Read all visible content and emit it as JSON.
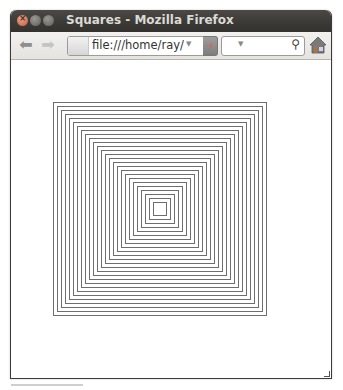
{
  "window": {
    "title": "Squares - Mozilla Firefox",
    "controls": [
      "close",
      "minimize",
      "maximize"
    ]
  },
  "toolbar": {
    "back_icon": "back-arrow-icon",
    "forward_icon": "forward-arrow-icon",
    "url": "file:///home/ray/squ",
    "go_icon": "go-arrow-icon",
    "search_value": "",
    "search_icon": "magnifier-icon",
    "home_icon": "home-icon"
  },
  "canvas": {
    "description": "Concentric squares",
    "center_x": 160,
    "center_y": 209,
    "outer_size": 214,
    "step": 4,
    "count": 26,
    "line_color": "#6e6e6e"
  }
}
